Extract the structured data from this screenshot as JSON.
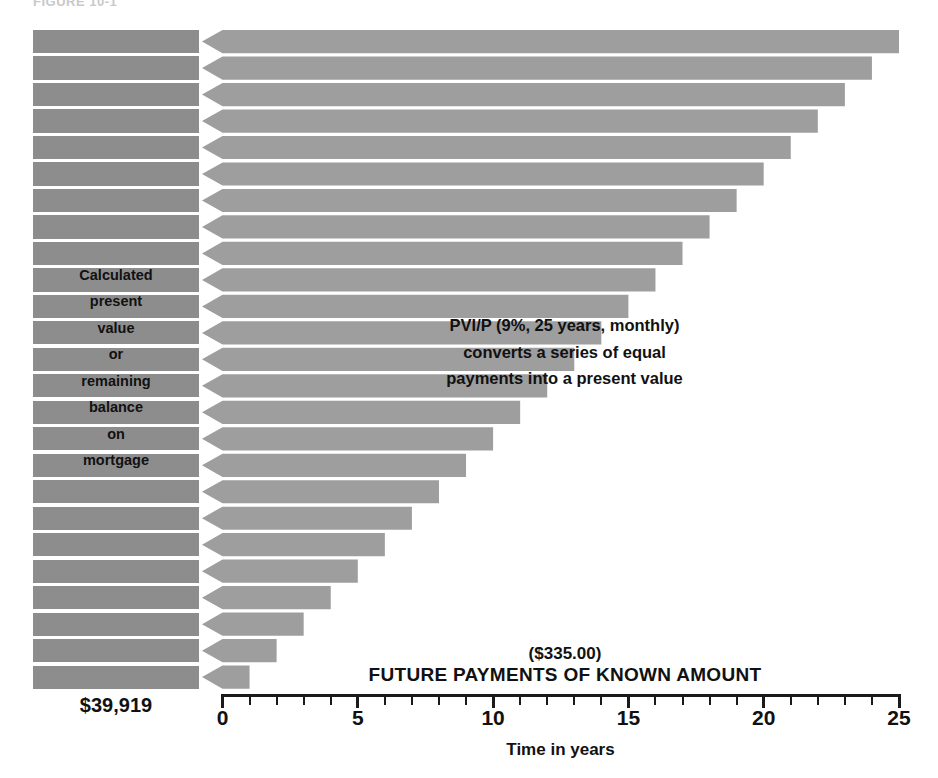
{
  "figure": {
    "title": "FIGURE 10-1"
  },
  "left_panel": {
    "caption_lines": [
      "Calculated",
      "present",
      "value",
      "or",
      "remaining",
      "balance",
      "on",
      "mortgage"
    ],
    "total_label": "$39,919"
  },
  "annotations": {
    "formula_note": "PVI/P (9%, 25 years, monthly)\nconverts a series of equal\npayments into a present value",
    "payment_amount": "($335.00)",
    "payments_caption": "FUTURE PAYMENTS OF KNOWN AMOUNT"
  },
  "axis": {
    "title": "Time in years",
    "labels": [
      "0",
      "5",
      "10",
      "15",
      "20",
      "25"
    ],
    "label_values": [
      0,
      5,
      10,
      15,
      20,
      25
    ],
    "min": 0,
    "max": 25,
    "minor_tick_step": 1
  },
  "colors": {
    "value_block": "#8d8d8d",
    "arrow_fill": "#9e9e9e",
    "background": "#ffffff",
    "ink": "#111111",
    "axis": "#1a1a1a"
  },
  "chart_data": {
    "type": "bar",
    "orientation": "horizontal",
    "title": "FIGURE 10-1",
    "subtitle": "Present value of a series of equal future payments",
    "xlabel": "Time in years",
    "ylabel": "",
    "xlim": [
      0,
      25
    ],
    "grid": false,
    "legend": null,
    "note": "Each horizontal left-pointing arrow represents one year's payment of $335.00 being discounted back to time 0; the stacked blocks at the left are the discounted present values summing to $39,919.",
    "categories": [
      "Year 25",
      "Year 24",
      "Year 23",
      "Year 22",
      "Year 21",
      "Year 20",
      "Year 19",
      "Year 18",
      "Year 17",
      "Year 16",
      "Year 15",
      "Year 14",
      "Year 13",
      "Year 12",
      "Year 11",
      "Year 10",
      "Year 9",
      "Year 8",
      "Year 7",
      "Year 6",
      "Year 5",
      "Year 4",
      "Year 3",
      "Year 2",
      "Year 1"
    ],
    "values": [
      25,
      24,
      23,
      22,
      21,
      20,
      19,
      18,
      17,
      16,
      15,
      14,
      13,
      12,
      11,
      10,
      9,
      8,
      7,
      6,
      5,
      4,
      3,
      2,
      1
    ],
    "payment_per_period": 335.0,
    "total_present_value": 39919,
    "interest_rate": "9%",
    "term_years": 25,
    "compounding": "monthly"
  }
}
